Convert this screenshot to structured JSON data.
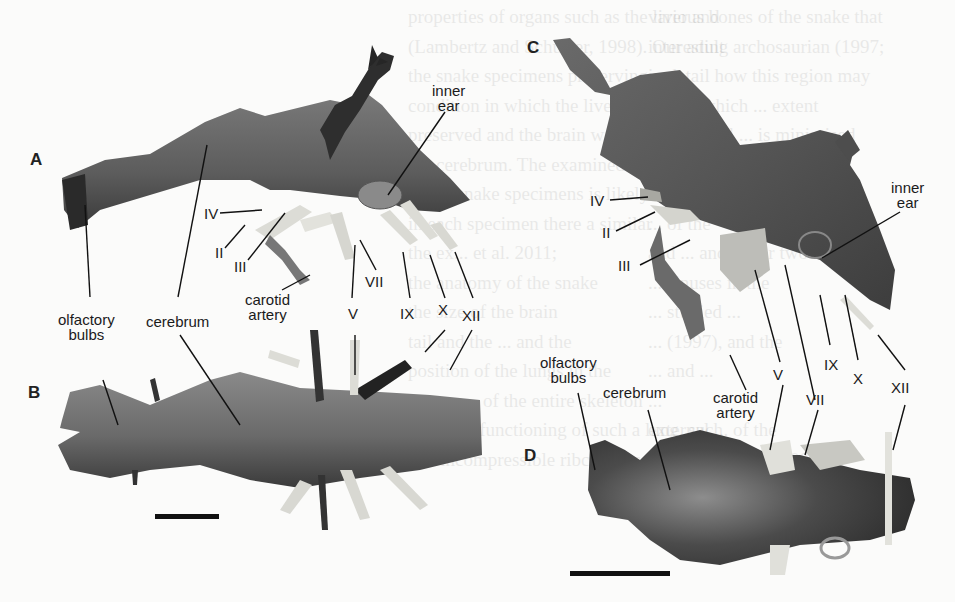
{
  "figure": {
    "panels": [
      {
        "id": "A",
        "view": "lateral endocast",
        "labels": [
          "inner ear",
          "IV",
          "II",
          "III",
          "VII",
          "carotid artery",
          "V",
          "IX",
          "X",
          "XII",
          "olfactory bulbs",
          "cerebrum"
        ]
      },
      {
        "id": "B",
        "view": "dorsal endocast",
        "labels": [
          "olfactory bulbs",
          "cerebrum"
        ]
      },
      {
        "id": "C",
        "view": "lateral endocast",
        "labels": [
          "IV",
          "II",
          "III",
          "inner ear",
          "V",
          "VII",
          "IX",
          "X",
          "XII",
          "carotid artery"
        ]
      },
      {
        "id": "D",
        "view": "dorsal endocast",
        "labels": [
          "olfactory bulbs",
          "cerebrum",
          "carotid artery",
          "V",
          "VII",
          "XII"
        ]
      }
    ],
    "panel_letters": {
      "a": "A",
      "b": "B",
      "c": "C",
      "d": "D"
    },
    "labels": {
      "inner_ear": "inner\near",
      "olfactory_bulbs": "olfactory\nbulbs",
      "cerebrum": "cerebrum",
      "carotid_artery": "carotid\nartery",
      "n2": "II",
      "n3": "III",
      "n4": "IV",
      "n5": "V",
      "n7": "VII",
      "n9": "IX",
      "n10": "X",
      "n12": "XII"
    },
    "scale_bars": [
      "B scale bar",
      "D scale bar"
    ]
  },
  "background_text": {
    "left": [
      "properties of organs such as the liver and",
      "(Lambertz and Schuster, 1998). Our adult",
      "the snake specimens preserving a",
      "condition in which the liver was",
      "preserved and the brain was",
      "the cerebrum. The examined brain",
      "of the snake specimens is likely",
      "in each specimen there a similar",
      "the ex... et al. 2011;",
      "the anatomy of the snake",
      "the size of the brain",
      "tail and the ... and the",
      "position of the lungs in the",
      "posture... of the entire skeleton",
      "tal in the functioning of such a lung, such",
      "and incompressible ribcage, as well as"
    ],
    "right": [
      "various bones of the snake that",
      "interesting archosaurian (1997;",
      "in detail how this region may",
      "bones, which ... extent",
      "the internal ... is minimised",
      "also... the ... horseshoe",
      "are closed... for the para-",
      "... of the",
      "and ... and lower two",
      "... sinuses in the",
      "... studied ...",
      "... (1997), and the",
      "... and ...",
      "...",
      "external ... of the",
      "though this is ... (2009)."
    ]
  }
}
